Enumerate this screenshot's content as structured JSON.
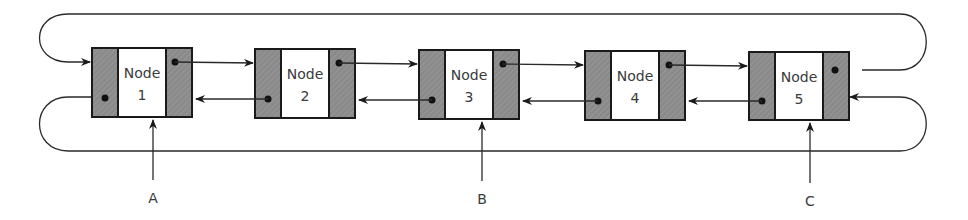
{
  "diagram": {
    "type": "circular doubly linked list",
    "colors": {
      "line": "#2a2a2a",
      "pointer_field": "#8a8a8a",
      "data_field": "#ffffff",
      "text": "#3a3a3a"
    },
    "nodes": [
      {
        "id": 1,
        "title": "Node",
        "number": "1"
      },
      {
        "id": 2,
        "title": "Node",
        "number": "2"
      },
      {
        "id": 3,
        "title": "Node",
        "number": "3"
      },
      {
        "id": 4,
        "title": "Node",
        "number": "4"
      },
      {
        "id": 5,
        "title": "Node",
        "number": "5"
      }
    ],
    "pointers": [
      {
        "label": "A",
        "target_node": 1
      },
      {
        "label": "B",
        "target_node": 3
      },
      {
        "label": "C",
        "target_node": 5
      }
    ]
  }
}
